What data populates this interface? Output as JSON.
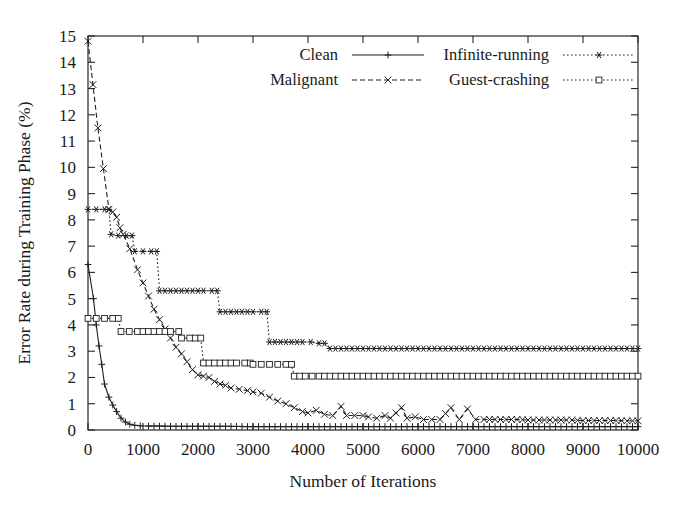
{
  "chart_data": {
    "type": "line",
    "title": "",
    "xlabel": "Number of Iterations",
    "ylabel": "Error Rate during Training Phase (%)",
    "xlim": [
      0,
      10000
    ],
    "ylim": [
      0,
      15
    ],
    "xticks": [
      0,
      1000,
      2000,
      3000,
      4000,
      5000,
      6000,
      7000,
      8000,
      9000,
      10000
    ],
    "xtick_labels": [
      "0",
      "1000",
      "2000",
      "3000",
      "4000",
      "5000",
      "6000",
      "7000",
      "8000",
      "9000",
      "10000"
    ],
    "yticks": [
      0,
      1,
      2,
      3,
      4,
      5,
      6,
      7,
      8,
      9,
      10,
      11,
      12,
      13,
      14,
      15
    ],
    "ytick_labels": [
      "0",
      "1",
      "2",
      "3",
      "4",
      "5",
      "6",
      "7",
      "8",
      "9",
      "10",
      "11",
      "12",
      "13",
      "14",
      "15"
    ],
    "grid": false,
    "legend_position": "top-inside",
    "series": [
      {
        "name": "Clean",
        "marker": "plus",
        "linestyle": "solid",
        "color": "#1f1f1f",
        "points": [
          [
            0,
            6.3
          ],
          [
            100,
            5.0
          ],
          [
            150,
            4.0
          ],
          [
            200,
            3.2
          ],
          [
            250,
            2.5
          ],
          [
            300,
            1.75
          ],
          [
            380,
            1.25
          ],
          [
            450,
            0.95
          ],
          [
            520,
            0.7
          ],
          [
            600,
            0.45
          ],
          [
            680,
            0.3
          ],
          [
            760,
            0.22
          ],
          [
            850,
            0.18
          ],
          [
            950,
            0.16
          ],
          [
            1100,
            0.15
          ],
          [
            1300,
            0.15
          ],
          [
            1500,
            0.14
          ],
          [
            1800,
            0.14
          ],
          [
            2100,
            0.14
          ],
          [
            2500,
            0.14
          ],
          [
            2900,
            0.13
          ],
          [
            3300,
            0.13
          ],
          [
            3700,
            0.13
          ],
          [
            4100,
            0.13
          ],
          [
            4500,
            0.13
          ],
          [
            5000,
            0.13
          ],
          [
            5500,
            0.13
          ],
          [
            6000,
            0.13
          ],
          [
            6500,
            0.13
          ],
          [
            7000,
            0.13
          ],
          [
            7500,
            0.13
          ],
          [
            8000,
            0.13
          ],
          [
            8500,
            0.13
          ],
          [
            9000,
            0.13
          ],
          [
            9500,
            0.13
          ],
          [
            10000,
            0.13
          ]
        ]
      },
      {
        "name": "Malignant",
        "marker": "cross",
        "linestyle": "dashed",
        "color": "#1f1f1f",
        "points": [
          [
            0,
            14.8
          ],
          [
            180,
            11.5
          ],
          [
            380,
            8.4
          ],
          [
            450,
            8.3
          ],
          [
            520,
            8.1
          ],
          [
            580,
            7.7
          ],
          [
            640,
            7.45
          ],
          [
            760,
            6.9
          ],
          [
            900,
            6.1
          ],
          [
            1000,
            5.6
          ],
          [
            1100,
            5.1
          ],
          [
            1200,
            4.6
          ],
          [
            1300,
            4.2
          ],
          [
            1400,
            3.85
          ],
          [
            1500,
            3.5
          ],
          [
            1600,
            3.15
          ],
          [
            1700,
            2.9
          ],
          [
            1800,
            2.6
          ],
          [
            1900,
            2.3
          ],
          [
            2000,
            2.1
          ],
          [
            2100,
            2.05
          ],
          [
            2200,
            2.0
          ],
          [
            2300,
            1.85
          ],
          [
            2400,
            1.75
          ],
          [
            2500,
            1.7
          ],
          [
            2600,
            1.6
          ],
          [
            2750,
            1.55
          ],
          [
            2900,
            1.5
          ],
          [
            3000,
            1.45
          ],
          [
            3150,
            1.4
          ],
          [
            3300,
            1.25
          ],
          [
            3450,
            1.1
          ],
          [
            3600,
            1.0
          ],
          [
            3750,
            0.85
          ],
          [
            3900,
            0.7
          ],
          [
            4000,
            0.65
          ],
          [
            4150,
            0.75
          ],
          [
            4300,
            0.6
          ],
          [
            4450,
            0.55
          ],
          [
            4600,
            0.9
          ],
          [
            4700,
            0.55
          ],
          [
            4850,
            0.55
          ],
          [
            5000,
            0.55
          ],
          [
            5100,
            0.5
          ],
          [
            5250,
            0.45
          ],
          [
            5400,
            0.55
          ],
          [
            5500,
            0.45
          ],
          [
            5700,
            0.85
          ],
          [
            5800,
            0.45
          ],
          [
            5950,
            0.5
          ],
          [
            6100,
            0.4
          ],
          [
            6250,
            0.4
          ],
          [
            6400,
            0.4
          ],
          [
            6600,
            0.85
          ],
          [
            6750,
            0.4
          ],
          [
            6900,
            0.8
          ],
          [
            7050,
            0.4
          ],
          [
            7200,
            0.4
          ],
          [
            7400,
            0.4
          ],
          [
            7600,
            0.4
          ],
          [
            7800,
            0.4
          ],
          [
            8000,
            0.38
          ],
          [
            8200,
            0.38
          ],
          [
            8400,
            0.38
          ],
          [
            8600,
            0.38
          ],
          [
            8800,
            0.38
          ],
          [
            9000,
            0.36
          ],
          [
            9200,
            0.36
          ],
          [
            9400,
            0.36
          ],
          [
            9600,
            0.36
          ],
          [
            9800,
            0.35
          ],
          [
            10000,
            0.35
          ]
        ]
      },
      {
        "name": "Infinite-running",
        "marker": "star",
        "linestyle": "dotted",
        "color": "#1f1f1f",
        "points": [
          [
            0,
            8.4
          ],
          [
            150,
            8.4
          ],
          [
            300,
            8.4
          ],
          [
            380,
            8.4
          ],
          [
            420,
            7.45
          ],
          [
            550,
            7.4
          ],
          [
            700,
            7.4
          ],
          [
            800,
            7.4
          ],
          [
            850,
            6.8
          ],
          [
            1000,
            6.8
          ],
          [
            1150,
            6.8
          ],
          [
            1250,
            6.8
          ],
          [
            1300,
            5.3
          ],
          [
            1500,
            5.3
          ],
          [
            1700,
            5.3
          ],
          [
            1900,
            5.3
          ],
          [
            2100,
            5.3
          ],
          [
            2250,
            5.3
          ],
          [
            2350,
            5.3
          ],
          [
            2400,
            4.5
          ],
          [
            2600,
            4.5
          ],
          [
            2800,
            4.5
          ],
          [
            3000,
            4.5
          ],
          [
            3150,
            4.5
          ],
          [
            3250,
            4.5
          ],
          [
            3300,
            3.35
          ],
          [
            3500,
            3.35
          ],
          [
            3700,
            3.35
          ],
          [
            3900,
            3.35
          ],
          [
            4050,
            3.35
          ],
          [
            4200,
            3.3
          ],
          [
            4300,
            3.3
          ],
          [
            4400,
            3.1
          ],
          [
            4600,
            3.1
          ],
          [
            4900,
            3.1
          ],
          [
            5200,
            3.1
          ],
          [
            5500,
            3.1
          ],
          [
            5800,
            3.1
          ],
          [
            6100,
            3.1
          ],
          [
            6400,
            3.1
          ],
          [
            6700,
            3.1
          ],
          [
            7000,
            3.1
          ],
          [
            7300,
            3.1
          ],
          [
            7600,
            3.1
          ],
          [
            7900,
            3.1
          ],
          [
            8200,
            3.1
          ],
          [
            8500,
            3.1
          ],
          [
            8800,
            3.1
          ],
          [
            9100,
            3.1
          ],
          [
            9400,
            3.1
          ],
          [
            9700,
            3.1
          ],
          [
            10000,
            3.1
          ]
        ]
      },
      {
        "name": "Guest-crashing",
        "marker": "square",
        "linestyle": "dotted",
        "color": "#1f1f1f",
        "points": [
          [
            0,
            4.25
          ],
          [
            150,
            4.25
          ],
          [
            300,
            4.25
          ],
          [
            450,
            4.25
          ],
          [
            550,
            4.25
          ],
          [
            600,
            3.75
          ],
          [
            750,
            3.75
          ],
          [
            900,
            3.75
          ],
          [
            1100,
            3.75
          ],
          [
            1300,
            3.75
          ],
          [
            1500,
            3.75
          ],
          [
            1650,
            3.75
          ],
          [
            1700,
            3.5
          ],
          [
            1850,
            3.5
          ],
          [
            1950,
            3.5
          ],
          [
            2050,
            3.5
          ],
          [
            2100,
            2.55
          ],
          [
            2300,
            2.55
          ],
          [
            2500,
            2.55
          ],
          [
            2700,
            2.55
          ],
          [
            2850,
            2.55
          ],
          [
            2950,
            2.55
          ],
          [
            3000,
            2.5
          ],
          [
            3150,
            2.5
          ],
          [
            3300,
            2.5
          ],
          [
            3450,
            2.5
          ],
          [
            3600,
            2.5
          ],
          [
            3700,
            2.5
          ],
          [
            3750,
            2.05
          ],
          [
            3950,
            2.05
          ],
          [
            4200,
            2.05
          ],
          [
            4500,
            2.05
          ],
          [
            4800,
            2.05
          ],
          [
            5100,
            2.05
          ],
          [
            5400,
            2.05
          ],
          [
            5700,
            2.05
          ],
          [
            6000,
            2.05
          ],
          [
            6300,
            2.05
          ],
          [
            6600,
            2.05
          ],
          [
            6900,
            2.05
          ],
          [
            7200,
            2.05
          ],
          [
            7500,
            2.05
          ],
          [
            7800,
            2.05
          ],
          [
            8100,
            2.05
          ],
          [
            8400,
            2.05
          ],
          [
            8700,
            2.05
          ],
          [
            9000,
            2.05
          ],
          [
            9300,
            2.05
          ],
          [
            9600,
            2.05
          ],
          [
            10000,
            2.05
          ]
        ]
      }
    ]
  },
  "legend": {
    "entries": [
      {
        "label": "Clean",
        "marker": "plus",
        "linestyle": "solid"
      },
      {
        "label": "Malignant",
        "marker": "cross",
        "linestyle": "dashed"
      },
      {
        "label": "Infinite-running",
        "marker": "star",
        "linestyle": "dotted"
      },
      {
        "label": "Guest-crashing",
        "marker": "square",
        "linestyle": "dotted"
      }
    ]
  }
}
